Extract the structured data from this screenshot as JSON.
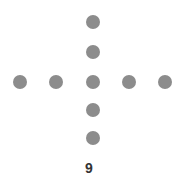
{
  "dot_color": "#8c8c8c",
  "dots": [
    {
      "x": 93,
      "y": 22
    },
    {
      "x": 93,
      "y": 52
    },
    {
      "x": 20,
      "y": 82
    },
    {
      "x": 56,
      "y": 82
    },
    {
      "x": 93,
      "y": 82
    },
    {
      "x": 129,
      "y": 82
    },
    {
      "x": 165,
      "y": 82
    },
    {
      "x": 93,
      "y": 110
    },
    {
      "x": 93,
      "y": 138
    }
  ],
  "count_label": "9"
}
